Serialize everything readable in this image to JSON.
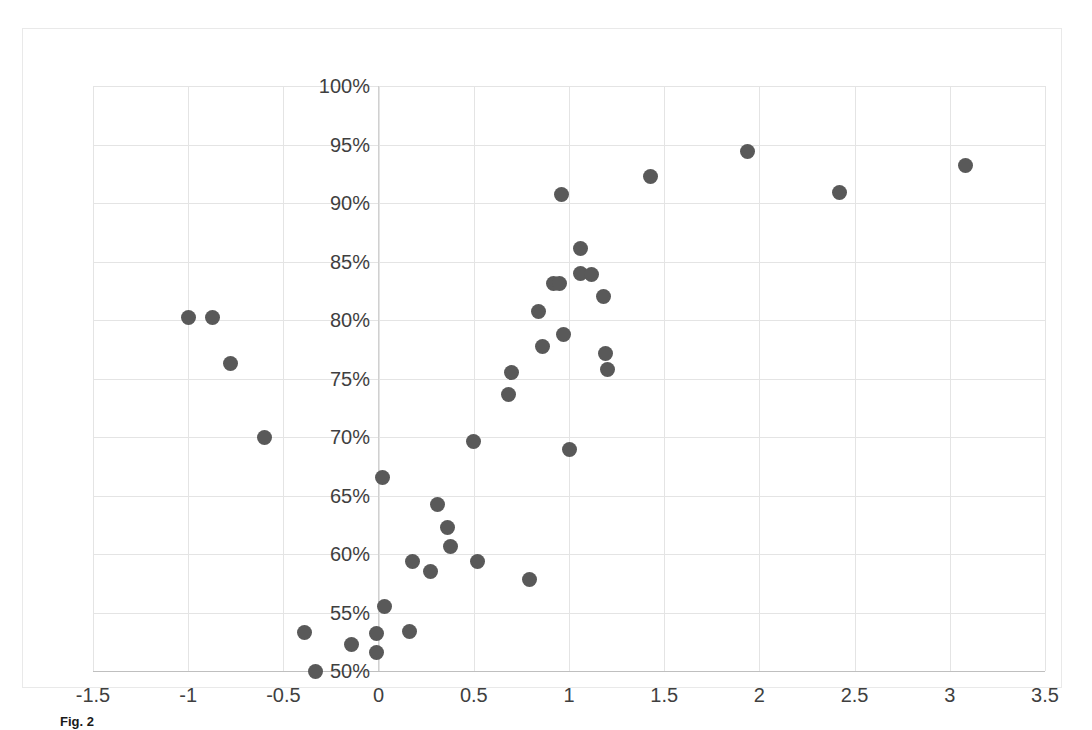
{
  "figure": {
    "caption_label": "Fig. 2",
    "caption_text": "",
    "border_color": "#e9e9e9",
    "background_color": "#ffffff"
  },
  "chart_data": {
    "type": "scatter",
    "title": "",
    "xlabel": "",
    "ylabel": "",
    "xlim": [
      -1.5,
      3.5
    ],
    "ylim": [
      50,
      100
    ],
    "xticks": [
      "-1.5",
      "-1",
      "-0.5",
      "0",
      "0.5",
      "1",
      "1.5",
      "2",
      "2.5",
      "3",
      "3.5"
    ],
    "xtick_values": [
      -1.5,
      -1,
      -0.5,
      0,
      0.5,
      1,
      1.5,
      2,
      2.5,
      3,
      3.5
    ],
    "yticks": [
      "50%",
      "55%",
      "60%",
      "65%",
      "70%",
      "75%",
      "80%",
      "85%",
      "90%",
      "95%",
      "100%"
    ],
    "ytick_values": [
      50,
      55,
      60,
      65,
      70,
      75,
      80,
      85,
      90,
      95,
      100
    ],
    "grid": true,
    "legend": "none",
    "marker_color": "#595959",
    "marker_size": 15,
    "series": [
      {
        "name": "observations",
        "points": [
          [
            -1.0,
            80.2
          ],
          [
            -0.87,
            80.2
          ],
          [
            -0.78,
            76.3
          ],
          [
            -0.6,
            70.0
          ],
          [
            -0.39,
            53.3
          ],
          [
            -0.33,
            50.0
          ],
          [
            -0.14,
            52.3
          ],
          [
            -0.01,
            53.2
          ],
          [
            -0.01,
            51.6
          ],
          [
            0.02,
            66.5
          ],
          [
            0.03,
            55.5
          ],
          [
            0.16,
            53.4
          ],
          [
            0.18,
            59.4
          ],
          [
            0.27,
            58.5
          ],
          [
            0.31,
            64.2
          ],
          [
            0.36,
            62.3
          ],
          [
            0.38,
            60.6
          ],
          [
            0.5,
            69.6
          ],
          [
            0.52,
            59.4
          ],
          [
            0.68,
            73.6
          ],
          [
            0.7,
            75.5
          ],
          [
            0.79,
            57.8
          ],
          [
            0.84,
            80.7
          ],
          [
            0.86,
            77.7
          ],
          [
            0.92,
            83.1
          ],
          [
            0.95,
            83.1
          ],
          [
            0.96,
            90.7
          ],
          [
            0.97,
            78.8
          ],
          [
            1.0,
            68.9
          ],
          [
            1.06,
            86.1
          ],
          [
            1.06,
            84.0
          ],
          [
            1.12,
            83.9
          ],
          [
            1.18,
            82.0
          ],
          [
            1.19,
            77.1
          ],
          [
            1.2,
            75.8
          ],
          [
            1.43,
            92.3
          ],
          [
            1.94,
            94.4
          ],
          [
            2.42,
            90.9
          ],
          [
            3.08,
            93.2
          ]
        ]
      }
    ]
  }
}
